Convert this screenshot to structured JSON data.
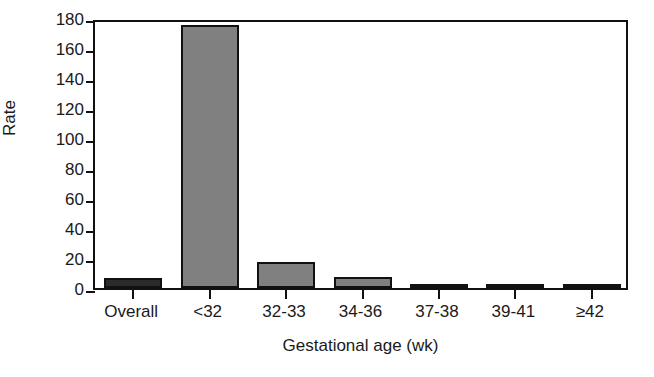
{
  "chart_data": {
    "type": "bar",
    "title": "",
    "xlabel": "Gestational age (wk)",
    "ylabel": "Rate",
    "categories": [
      "Overall",
      "<32",
      "32-33",
      "34-36",
      "37-38",
      "39-41",
      "≥42"
    ],
    "values": [
      6.5,
      175.5,
      17.5,
      7.5,
      3.0,
      1.5,
      2.5
    ],
    "ylim": [
      0,
      180
    ],
    "yticks": [
      0,
      20,
      40,
      60,
      80,
      100,
      120,
      140,
      160,
      180
    ],
    "ytick_labels": [
      "0",
      "20",
      "40",
      "60",
      "80",
      "100",
      "120",
      "140",
      "160",
      "180"
    ],
    "grid": false,
    "legend": null,
    "bar_colors": [
      "#2b2b2b",
      "#808080",
      "#808080",
      "#808080",
      "#808080",
      "#808080",
      "#808080"
    ],
    "bar_edge_color": "#111111",
    "axis_color": "#111111",
    "background": "#ffffff"
  }
}
